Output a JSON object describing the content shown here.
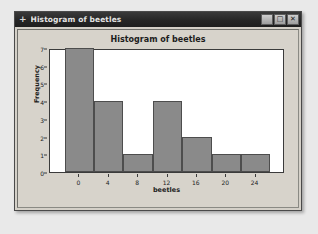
{
  "window": {
    "title": "Histogram of beetles",
    "move_icon": "+",
    "controls": [
      {
        "name": "minimize",
        "glyph": "_"
      },
      {
        "name": "maximize",
        "glyph": "□"
      },
      {
        "name": "close",
        "glyph": "✕"
      }
    ]
  },
  "chart_data": {
    "type": "bar",
    "title": "Histogram of beetles",
    "xlabel": "beetles",
    "ylabel": "Frequency",
    "bin_width": 4,
    "bin_starts": [
      -2,
      2,
      6,
      10,
      14,
      18,
      22
    ],
    "bin_ends": [
      2,
      6,
      10,
      14,
      18,
      22,
      26
    ],
    "categories": [
      "-2 to 2",
      "2 to 6",
      "6 to 10",
      "10 to 14",
      "14 to 18",
      "18 to 22",
      "22 to 26"
    ],
    "values": [
      7,
      4,
      1,
      4,
      2,
      1,
      1
    ],
    "xlim": [
      -4,
      28
    ],
    "ylim": [
      0,
      7
    ],
    "xticks": [
      0,
      4,
      8,
      12,
      16,
      20,
      24
    ],
    "xtick_labels": [
      "0",
      "4",
      "8",
      "12",
      "16",
      "20",
      "24"
    ],
    "yticks": [
      0,
      1,
      2,
      3,
      4,
      5,
      6,
      7
    ],
    "ytick_labels": [
      "0",
      "1",
      "2",
      "3",
      "4",
      "5",
      "6",
      "7"
    ],
    "grid": false,
    "legend": false,
    "bar_fill_color": "#8a8a8a",
    "bar_edge_color": "#4d4d4d",
    "plot_background": "#ffffff"
  }
}
